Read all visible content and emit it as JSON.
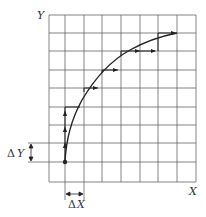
{
  "diagram": {
    "title": "",
    "axis_labels": {
      "x": "X",
      "y": "Y"
    },
    "delta_labels": {
      "dx_symbol": "Δ",
      "dx_var": "X",
      "dy_symbol": "Δ",
      "dy_var": "Y"
    },
    "grid": {
      "x_lines": [
        49,
        65,
        84,
        102,
        121,
        140,
        158,
        177,
        196
      ],
      "y_lines": [
        15,
        33,
        51,
        70,
        88,
        107,
        125,
        143,
        162,
        182
      ]
    },
    "curve": {
      "description": "Concave curve from start point stepping up with incremental ΔX/ΔY moves",
      "start_point": [
        65,
        162
      ],
      "end_point": [
        177,
        33
      ]
    },
    "colors": {
      "grid": "#555555",
      "curve": "#222222",
      "background": "#ffffff"
    }
  }
}
